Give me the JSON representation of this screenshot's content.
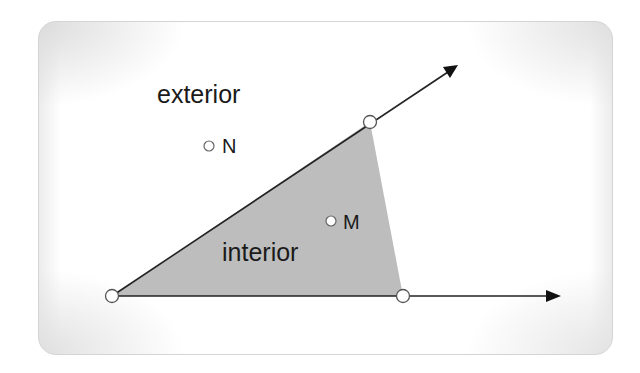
{
  "diagram": {
    "type": "angle-interior-exterior",
    "labels": {
      "exterior": "exterior",
      "interior": "interior",
      "point_n": "N",
      "point_m": "M"
    },
    "colors": {
      "region_fill": "#bdbdbd",
      "stroke": "#222222",
      "point_fill": "#ffffff",
      "point_stroke": "#555555"
    },
    "geometry": {
      "vertex": [
        112,
        296
      ],
      "upper_ray_point": [
        370,
        122
      ],
      "upper_ray_arrow_tip": [
        458,
        65
      ],
      "lower_ray_point": [
        403,
        296
      ],
      "lower_ray_arrow_tip": [
        560,
        296
      ],
      "point_n": [
        209,
        146
      ],
      "point_m": [
        331,
        221
      ]
    }
  }
}
